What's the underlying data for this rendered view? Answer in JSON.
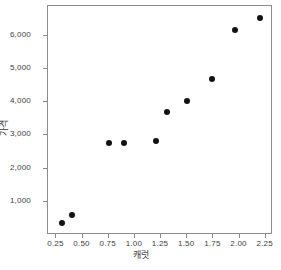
{
  "chart_data": {
    "type": "scatter",
    "title": "",
    "xlabel": "캐럿",
    "ylabel": "가격",
    "xlim": [
      0.17,
      2.32
    ],
    "ylim": [
      0,
      6900
    ],
    "grid": false,
    "legend": null,
    "xticks": [
      0.25,
      0.5,
      0.75,
      1.0,
      1.25,
      1.5,
      1.75,
      2.0,
      2.25
    ],
    "xtick_labels": [
      "0.25",
      "0.50",
      "0.75",
      "1.00",
      "1.25",
      "1.50",
      "1.75",
      "2.00",
      "2.25"
    ],
    "yticks": [
      1000,
      2000,
      3000,
      4000,
      5000,
      6000
    ],
    "ytick_labels": [
      "1,000",
      "2,000",
      "3,000",
      "4,000",
      "5,000",
      "6,000"
    ],
    "marker": "filled-circle",
    "marker_color": "#121212",
    "points": [
      {
        "x": 0.3,
        "y": 350
      },
      {
        "x": 0.4,
        "y": 590
      },
      {
        "x": 0.75,
        "y": 2780
      },
      {
        "x": 0.9,
        "y": 2780
      },
      {
        "x": 1.2,
        "y": 2830
      },
      {
        "x": 1.31,
        "y": 3720
      },
      {
        "x": 1.5,
        "y": 4040
      },
      {
        "x": 1.74,
        "y": 4710
      },
      {
        "x": 1.96,
        "y": 6170
      },
      {
        "x": 2.2,
        "y": 6550
      }
    ],
    "series": [
      {
        "name": "diamonds",
        "x": [
          0.3,
          0.4,
          0.75,
          0.9,
          1.2,
          1.31,
          1.5,
          1.74,
          1.96,
          2.2
        ],
        "values": [
          350,
          590,
          2780,
          2780,
          2830,
          3720,
          4040,
          4710,
          6170,
          6550
        ]
      }
    ]
  },
  "colors": {
    "frame": "#8c8c8c",
    "marker": "#121212",
    "text": "#3c3c3c",
    "background": "#ffffff"
  }
}
